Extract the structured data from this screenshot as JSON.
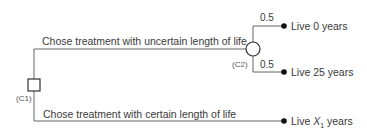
{
  "diagram": {
    "type": "decision-tree",
    "nodes": {
      "c1": {
        "label": "(C1)",
        "shape": "square"
      },
      "c2": {
        "label": "(C2)",
        "shape": "circle"
      }
    },
    "branches": {
      "uncertain": {
        "label": "Chose treatment with uncertain length of life"
      },
      "certain": {
        "label": "Chose treatment with certain length of life"
      }
    },
    "chance_branches": [
      {
        "probability": "0.5",
        "outcome": "Live 0 years"
      },
      {
        "probability": "0.5",
        "outcome": "Live 25 years"
      }
    ],
    "certain_outcome": {
      "prefix": "Live ",
      "variable": "X",
      "subscript": "1",
      "suffix": " years"
    },
    "colors": {
      "line": "#555555",
      "dot": "#111111"
    }
  }
}
